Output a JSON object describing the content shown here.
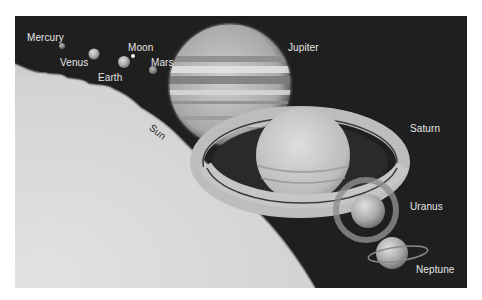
{
  "figure": {
    "title": "",
    "background_color": "#1f1f1f",
    "sun_color": "#d8d8d8"
  },
  "bodies": [
    {
      "name": "Sun",
      "label": "Sun"
    },
    {
      "name": "Mercury",
      "label": "Mercury"
    },
    {
      "name": "Venus",
      "label": "Venus"
    },
    {
      "name": "Earth",
      "label": "Earth"
    },
    {
      "name": "Moon",
      "label": "Moon"
    },
    {
      "name": "Mars",
      "label": "Mars"
    },
    {
      "name": "Jupiter",
      "label": "Jupiter"
    },
    {
      "name": "Saturn",
      "label": "Saturn"
    },
    {
      "name": "Uranus",
      "label": "Uranus"
    },
    {
      "name": "Neptune",
      "label": "Neptune"
    }
  ]
}
